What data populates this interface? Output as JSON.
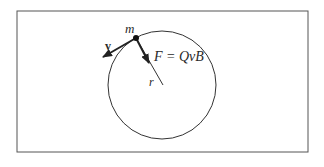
{
  "diagram": {
    "labels": {
      "mass": "m",
      "velocity": "v",
      "force": "F = QvB",
      "radius": "r"
    },
    "colors": {
      "stroke": "#333333",
      "frame": "#555555",
      "background": "#ffffff"
    }
  }
}
